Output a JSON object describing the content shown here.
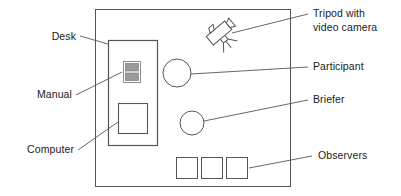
{
  "figure": {
    "type": "room-layout-diagram",
    "stroke_color": "#555555",
    "text_color": "#1a1a1a",
    "fill_color": "#ffffff",
    "manual_fill_color": "#9a9a9a",
    "background_color": "#ffffff"
  },
  "labels": {
    "desk": "Desk",
    "manual": "Manual",
    "computer": "Computer",
    "tripod_line1": "Tripod with",
    "tripod_line2": "video camera",
    "participant": "Participant",
    "briefer": "Briefer",
    "observers": "Observers"
  },
  "shapes": {
    "room": {
      "name": "room-outline",
      "x": 95,
      "y": 9,
      "width": 195,
      "height": 177
    },
    "desk": {
      "name": "desk",
      "x": 108,
      "y": 40,
      "width": 49,
      "height": 105
    },
    "manual": {
      "name": "manual",
      "x": 123,
      "y": 61,
      "width": 17,
      "height": 21,
      "bars": 2
    },
    "computer": {
      "name": "computer",
      "x": 118,
      "y": 103,
      "width": 29,
      "height": 30
    },
    "participant": {
      "name": "participant-circle",
      "cx": 177,
      "cy": 73,
      "r": 14
    },
    "briefer": {
      "name": "briefer-circle",
      "cx": 192,
      "cy": 123,
      "r": 12
    },
    "camera": {
      "name": "video-camera",
      "cx": 219,
      "cy": 33,
      "rotation_deg": -40
    },
    "observers": [
      {
        "name": "observer-seat-1",
        "x": 176,
        "y": 157,
        "width": 21,
        "height": 21
      },
      {
        "name": "observer-seat-2",
        "x": 201,
        "y": 157,
        "width": 21,
        "height": 21
      },
      {
        "name": "observer-seat-3",
        "x": 226,
        "y": 157,
        "width": 21,
        "height": 21
      }
    ]
  },
  "leader_lines": {
    "desk": {
      "x1": 80,
      "y1": 36,
      "x2": 108,
      "y2": 44
    },
    "manual": {
      "x1": 76,
      "y1": 95,
      "x2": 122,
      "y2": 72
    },
    "computer": {
      "x1": 78,
      "y1": 150,
      "x2": 118,
      "y2": 122
    },
    "tripod": {
      "x1": 232,
      "y1": 33,
      "x2": 308,
      "y2": 14
    },
    "participant": {
      "x1": 191,
      "y1": 74,
      "x2": 308,
      "y2": 67
    },
    "briefer": {
      "x1": 204,
      "y1": 121,
      "x2": 308,
      "y2": 100
    },
    "observers": {
      "x1": 249,
      "y1": 168,
      "x2": 312,
      "y2": 156
    }
  }
}
